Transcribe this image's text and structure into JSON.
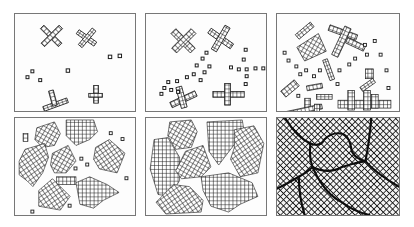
{
  "figure": {
    "colors": {
      "ink": "#1a1a1a",
      "frame": "#777777",
      "background": "#ffffff"
    },
    "panels": [
      {
        "id": 1,
        "stage": "nucleation",
        "row": 1,
        "col": 1
      },
      {
        "id": 2,
        "stage": "early-growth",
        "row": 1,
        "col": 2
      },
      {
        "id": 3,
        "stage": "dendritic-growth",
        "row": 1,
        "col": 3
      },
      {
        "id": 4,
        "stage": "crystallite-growth",
        "row": 2,
        "col": 1
      },
      {
        "id": 5,
        "stage": "impingement",
        "row": 2,
        "col": 2
      },
      {
        "id": 6,
        "stage": "grain-boundaries",
        "row": 2,
        "col": 3
      }
    ]
  }
}
